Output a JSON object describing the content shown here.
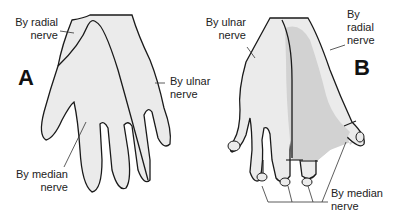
{
  "diagram": {
    "panels": [
      {
        "id": "A",
        "letter": "A",
        "labels": {
          "radial": [
            "By radial",
            "nerve"
          ],
          "ulnar": [
            "By ulnar",
            "nerve"
          ],
          "median": [
            "By median",
            "nerve"
          ]
        }
      },
      {
        "id": "B",
        "letter": "B",
        "labels": {
          "ulnar": [
            "By ulnar",
            "nerve"
          ],
          "radial": [
            "By",
            "radial",
            "nerve"
          ],
          "median": [
            "By median",
            "nerve"
          ]
        }
      }
    ],
    "colors": {
      "light_region": "#ebebeb",
      "dark_region": "#d2d2d2",
      "outline": "#1a1a1a",
      "text": "#222222"
    }
  }
}
